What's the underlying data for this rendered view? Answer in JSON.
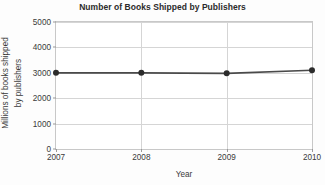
{
  "chart_data": {
    "type": "line",
    "title": "Number of Books Shipped by Publishers",
    "xlabel": "Year",
    "ylabel": "Millions of books shipped by publishers",
    "ylabel_lines": [
      "Millions of books shipped",
      "by publishers"
    ],
    "categories": [
      "2007",
      "2008",
      "2009",
      "2010"
    ],
    "x": [
      2007,
      2008,
      2009,
      2010
    ],
    "values": [
      3000,
      3000,
      2980,
      3100
    ],
    "series": [
      {
        "name": "Books shipped",
        "values": [
          3000,
          3000,
          2980,
          3100
        ]
      }
    ],
    "ylim": [
      0,
      5000
    ],
    "xlim": [
      2007,
      2010
    ],
    "yticks": [
      0,
      1000,
      2000,
      3000,
      4000,
      5000
    ],
    "ytick_labels": [
      "0",
      "1000",
      "2000",
      "3000",
      "4000",
      "5000"
    ],
    "xticks": [
      2007,
      2008,
      2009,
      2010
    ],
    "xtick_labels": [
      "2007",
      "2008",
      "2009",
      "2010"
    ],
    "grid": true,
    "grid_axis": "both",
    "legend": false,
    "legend_position": "none",
    "marker": "circle",
    "line_color": "#4a4a4a",
    "marker_color": "#2b2b2b",
    "grid_color": "#d5d5d5",
    "axis_color": "#c8c8c8",
    "background_color": "#ffffff"
  }
}
